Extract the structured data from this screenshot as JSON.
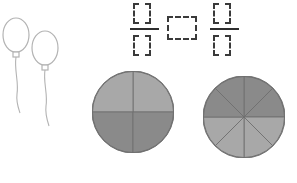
{
  "page": {
    "background_color": "#ffffff"
  },
  "decoration": {
    "balloons": {
      "name": "balloons illustration",
      "count": 2,
      "outline_color": "#b3b3b3",
      "fill_color": "#ffffff",
      "items": [
        {
          "label": "balloon 1",
          "cx": 16,
          "cy": 27,
          "rx": 13,
          "ry": 17
        },
        {
          "label": "balloon 2",
          "cx": 45,
          "cy": 40,
          "rx": 13,
          "ry": 17
        }
      ]
    }
  },
  "answer_row": {
    "name": "answer blanks",
    "dash_color": "#3a3a3a",
    "bar_color": "#2e2e2e",
    "left_fraction": {
      "label": "first fraction answer",
      "numerator_value": "",
      "denominator_value": "",
      "numerator_placeholder": "",
      "denominator_placeholder": ""
    },
    "comparison": {
      "label": "comparison symbol answer",
      "value": "",
      "placeholder": ""
    },
    "right_fraction": {
      "label": "second fraction answer",
      "numerator_value": "",
      "denominator_value": "",
      "numerator_placeholder": "",
      "denominator_placeholder": ""
    }
  },
  "chart_data": [
    {
      "type": "pie",
      "name": "circle-model-quarters",
      "title": "",
      "total_parts": 4,
      "shaded_parts": 2,
      "fraction": "2/4",
      "radius": 41,
      "center": [
        41,
        41
      ],
      "outline_color": "#6f6f6f",
      "divider_color": "#6f6f6f",
      "categories": [
        "sector 1",
        "sector 2",
        "sector 3",
        "sector 4"
      ],
      "values": [
        1,
        1,
        1,
        1
      ],
      "slice_colors": [
        "#a8a8a8",
        "#a8a8a8",
        "#8a8a8a",
        "#8a8a8a"
      ],
      "slices": [
        {
          "index": 0,
          "start_deg": 270,
          "end_deg": 360,
          "shade": "light",
          "color": "#a8a8a8"
        },
        {
          "index": 1,
          "start_deg": 180,
          "end_deg": 270,
          "shade": "light",
          "color": "#a8a8a8"
        },
        {
          "index": 2,
          "start_deg": 90,
          "end_deg": 180,
          "shade": "dark",
          "color": "#8a8a8a"
        },
        {
          "index": 3,
          "start_deg": 0,
          "end_deg": 90,
          "shade": "dark",
          "color": "#8a8a8a"
        }
      ],
      "legend": [
        {
          "label": "light gray (unshaded)",
          "color": "#a8a8a8"
        },
        {
          "label": "dark gray (shaded)",
          "color": "#8a8a8a"
        }
      ]
    },
    {
      "type": "pie",
      "name": "circle-model-eighths",
      "title": "",
      "total_parts": 8,
      "shaded_parts": 4,
      "fraction": "4/8",
      "radius": 41,
      "center": [
        41,
        41
      ],
      "outline_color": "#6f6f6f",
      "divider_color": "#6f6f6f",
      "categories": [
        "sector 1",
        "sector 2",
        "sector 3",
        "sector 4",
        "sector 5",
        "sector 6",
        "sector 7",
        "sector 8"
      ],
      "values": [
        1,
        1,
        1,
        1,
        1,
        1,
        1,
        1
      ],
      "slice_colors": [
        "#8a8a8a",
        "#8a8a8a",
        "#a8a8a8",
        "#a8a8a8",
        "#a8a8a8",
        "#a8a8a8",
        "#8a8a8a",
        "#8a8a8a"
      ],
      "slices": [
        {
          "index": 0,
          "start_deg": 270,
          "end_deg": 315,
          "shade": "dark",
          "color": "#8a8a8a"
        },
        {
          "index": 1,
          "start_deg": 315,
          "end_deg": 360,
          "shade": "dark",
          "color": "#8a8a8a"
        },
        {
          "index": 2,
          "start_deg": 0,
          "end_deg": 45,
          "shade": "light",
          "color": "#a8a8a8"
        },
        {
          "index": 3,
          "start_deg": 45,
          "end_deg": 90,
          "shade": "light",
          "color": "#a8a8a8"
        },
        {
          "index": 4,
          "start_deg": 90,
          "end_deg": 135,
          "shade": "light",
          "color": "#a8a8a8"
        },
        {
          "index": 5,
          "start_deg": 135,
          "end_deg": 180,
          "shade": "light",
          "color": "#a8a8a8"
        },
        {
          "index": 6,
          "start_deg": 180,
          "end_deg": 225,
          "shade": "dark",
          "color": "#8a8a8a"
        },
        {
          "index": 7,
          "start_deg": 225,
          "end_deg": 270,
          "shade": "dark",
          "color": "#8a8a8a"
        }
      ],
      "legend": [
        {
          "label": "light gray (unshaded)",
          "color": "#a8a8a8"
        },
        {
          "label": "dark gray (shaded)",
          "color": "#8a8a8a"
        }
      ]
    }
  ]
}
